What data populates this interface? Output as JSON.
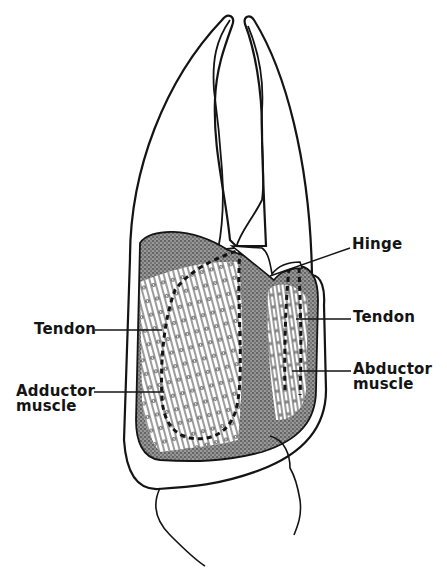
{
  "figure": {
    "colors": {
      "ink": "#141414",
      "background": "#ffffff",
      "stipple": "#555555"
    },
    "labels": {
      "hinge": "Hinge",
      "tendon_right": "Tendon",
      "tendon_left": "Tendon",
      "abductor_line1": "Abductor",
      "abductor_line2": "muscle",
      "adductor_line1": "Adductor",
      "adductor_line2": "muscle"
    }
  }
}
